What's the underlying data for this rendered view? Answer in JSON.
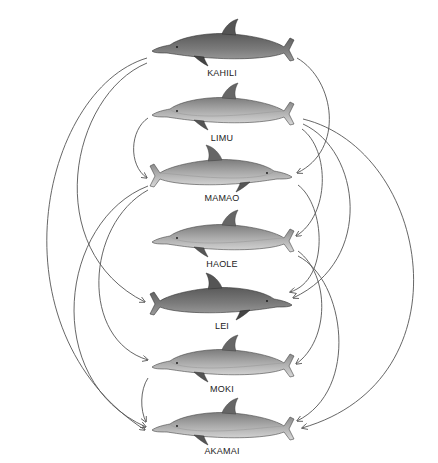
{
  "diagram": {
    "type": "social-network / association diagram",
    "nodes": [
      {
        "id": "kahili",
        "label": "KAHILI",
        "x": 222,
        "y": 45,
        "label_y": 95,
        "facing": "left",
        "shade": "dark"
      },
      {
        "id": "limu",
        "label": "LIMU",
        "x": 222,
        "y": 110,
        "label_y": 140,
        "facing": "left",
        "shade": "light"
      },
      {
        "id": "mamao",
        "label": "MAMAO",
        "x": 222,
        "y": 172,
        "label_y": 193,
        "facing": "right",
        "shade": "light"
      },
      {
        "id": "haole",
        "label": "HAOLE",
        "x": 222,
        "y": 237,
        "label_y": 260,
        "facing": "left",
        "shade": "light"
      },
      {
        "id": "lei",
        "label": "LEI",
        "x": 222,
        "y": 300,
        "label_y": 320,
        "facing": "right",
        "shade": "dark"
      },
      {
        "id": "moki",
        "label": "MOKI",
        "x": 222,
        "y": 362,
        "label_y": 384,
        "facing": "left",
        "shade": "light"
      },
      {
        "id": "akamai",
        "label": "AKAMAI",
        "x": 222,
        "y": 425,
        "label_y": 447,
        "facing": "left",
        "shade": "light"
      }
    ],
    "edges": [
      {
        "from": "KAHILI",
        "to": "LEI",
        "side": "left"
      },
      {
        "from": "KAHILI",
        "to": "AKAMAI",
        "side": "left"
      },
      {
        "from": "LIMU",
        "to": "MAMAO",
        "side": "left"
      },
      {
        "from": "MAMAO",
        "to": "MOKI",
        "side": "left"
      },
      {
        "from": "MAMAO",
        "to": "AKAMAI",
        "side": "left"
      },
      {
        "from": "MOKI",
        "to": "AKAMAI",
        "side": "left"
      },
      {
        "from": "KAHILI",
        "to": "MAMAO",
        "side": "right"
      },
      {
        "from": "LIMU",
        "to": "HAOLE",
        "side": "right"
      },
      {
        "from": "LIMU",
        "to": "LEI",
        "side": "right"
      },
      {
        "from": "LIMU",
        "to": "AKAMAI",
        "side": "right"
      },
      {
        "from": "MAMAO",
        "to": "LEI",
        "side": "right"
      },
      {
        "from": "HAOLE",
        "to": "MOKI",
        "side": "right"
      },
      {
        "from": "HAOLE",
        "to": "AKAMAI",
        "side": "right"
      }
    ],
    "colors": {
      "background": "#ffffff",
      "arrow": "#555555",
      "dolphin_dark_back": "#6a6a6a",
      "dolphin_light_back": "#8c8c8c",
      "dolphin_belly": "#cfcfcf",
      "label": "#222222"
    }
  }
}
